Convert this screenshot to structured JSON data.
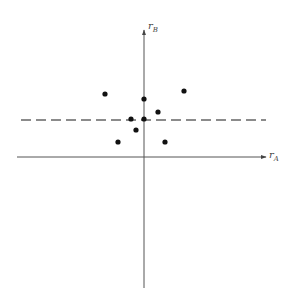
{
  "diagram": {
    "type": "scatter-on-axes",
    "x_axis": {
      "label": "r",
      "subscript": "A",
      "from": [
        17,
        157
      ],
      "to": [
        266,
        157
      ]
    },
    "y_axis": {
      "label": "r",
      "subscript": "B",
      "from": [
        144,
        288
      ],
      "to": [
        144,
        30
      ]
    },
    "dashed_line": {
      "y": 120,
      "x_start": 21,
      "x_end": 266,
      "color": "#666666"
    },
    "points": [
      {
        "x": 105,
        "y": 94
      },
      {
        "x": 184,
        "y": 91
      },
      {
        "x": 144,
        "y": 99
      },
      {
        "x": 158,
        "y": 112
      },
      {
        "x": 131,
        "y": 119
      },
      {
        "x": 144,
        "y": 119
      },
      {
        "x": 136,
        "y": 130
      },
      {
        "x": 118,
        "y": 142
      },
      {
        "x": 165,
        "y": 142
      }
    ],
    "colors": {
      "axis": "#555555",
      "point": "#111111",
      "dashed": "#666666"
    }
  }
}
